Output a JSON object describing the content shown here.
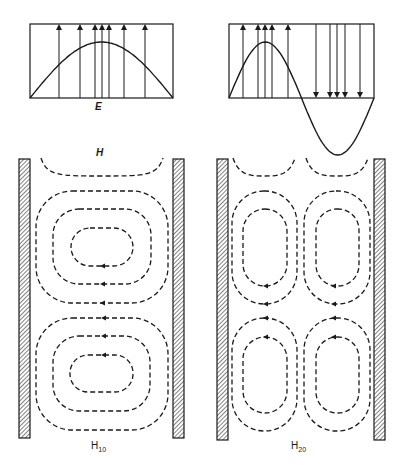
{
  "figure": {
    "labels": {
      "e_field": "E",
      "h_field": "H",
      "mode_left_base": "H",
      "mode_left_sub": "10",
      "mode_right_base": "H",
      "mode_right_sub": "20"
    },
    "colors": {
      "line": "#1a1a1a",
      "background": "#ffffff",
      "wall_hatch": "#1a1a1a"
    }
  },
  "e_panels": [
    {
      "name": "h10-e-field",
      "box": {
        "x": 30,
        "y": 24,
        "w": 143,
        "h": 74
      },
      "curve": "half-sine",
      "peak_y": 42,
      "arrows_up_x": [
        59,
        80,
        95,
        102,
        109,
        124,
        145
      ],
      "arrows_down_x": []
    },
    {
      "name": "h20-e-field",
      "box": {
        "x": 229,
        "y": 24,
        "w": 145,
        "h": 74
      },
      "curve": "full-sine",
      "peak_y": 42,
      "trough_y": 155,
      "arrows_up_x": [
        243,
        258,
        265,
        272,
        288
      ],
      "arrows_down_x": [
        316,
        330,
        337,
        345,
        360
      ]
    }
  ],
  "waveguides": [
    {
      "name": "h10-waveguide",
      "walls": [
        {
          "x": 19,
          "w": 11,
          "y": 159,
          "h": 279
        },
        {
          "x": 173,
          "w": 11,
          "y": 159,
          "h": 279
        }
      ],
      "top_arc": {
        "x1": 41,
        "x2": 163,
        "y_top": 158,
        "y_bottom": 176
      },
      "loop_sets": [
        {
          "loops": [
            {
              "x": 36,
              "y": 191,
              "w": 132,
              "h": 112,
              "r": 36
            },
            {
              "x": 53,
              "y": 209,
              "w": 98,
              "h": 75,
              "r": 26
            },
            {
              "x": 71,
              "y": 228,
              "w": 62,
              "h": 38,
              "r": 19
            }
          ],
          "arrow_side": "bottom",
          "arrow_x": 103
        },
        {
          "loops": [
            {
              "x": 36,
              "y": 318,
              "w": 132,
              "h": 112,
              "r": 36
            },
            {
              "x": 53,
              "y": 336,
              "w": 97,
              "h": 75,
              "r": 26
            },
            {
              "x": 70,
              "y": 355,
              "w": 63,
              "h": 37,
              "r": 18
            }
          ],
          "arrow_side": "top",
          "arrow_x": 104
        }
      ]
    },
    {
      "name": "h20-waveguide",
      "walls": [
        {
          "x": 217,
          "w": 11,
          "y": 159,
          "h": 281
        },
        {
          "x": 374,
          "w": 11,
          "y": 159,
          "h": 281
        }
      ],
      "top_arcs": [
        {
          "x1": 233,
          "x2": 295,
          "y_top": 158,
          "y_bottom": 176
        },
        {
          "x1": 306,
          "x2": 368,
          "y_top": 158,
          "y_bottom": 176
        }
      ],
      "loop_sets": [
        {
          "loops": [
            {
              "x": 232,
              "y": 191,
              "w": 65,
              "h": 113,
              "r": 32
            },
            {
              "x": 243,
              "y": 209,
              "w": 44,
              "h": 77,
              "r": 22
            },
            {
              "x": 304,
              "y": 191,
              "w": 66,
              "h": 113,
              "r": 32
            },
            {
              "x": 316,
              "y": 209,
              "w": 43,
              "h": 77,
              "r": 21
            }
          ],
          "arrow_side": "bottom",
          "arrow_x": [
            266,
            334
          ]
        },
        {
          "loops": [
            {
              "x": 232,
              "y": 318,
              "w": 65,
              "h": 113,
              "r": 32
            },
            {
              "x": 243,
              "y": 337,
              "w": 44,
              "h": 76,
              "r": 22
            },
            {
              "x": 304,
              "y": 318,
              "w": 66,
              "h": 113,
              "r": 32
            },
            {
              "x": 316,
              "y": 337,
              "w": 43,
              "h": 76,
              "r": 21
            }
          ],
          "arrow_side": "top",
          "arrow_x": [
            266,
            334
          ]
        }
      ]
    }
  ]
}
